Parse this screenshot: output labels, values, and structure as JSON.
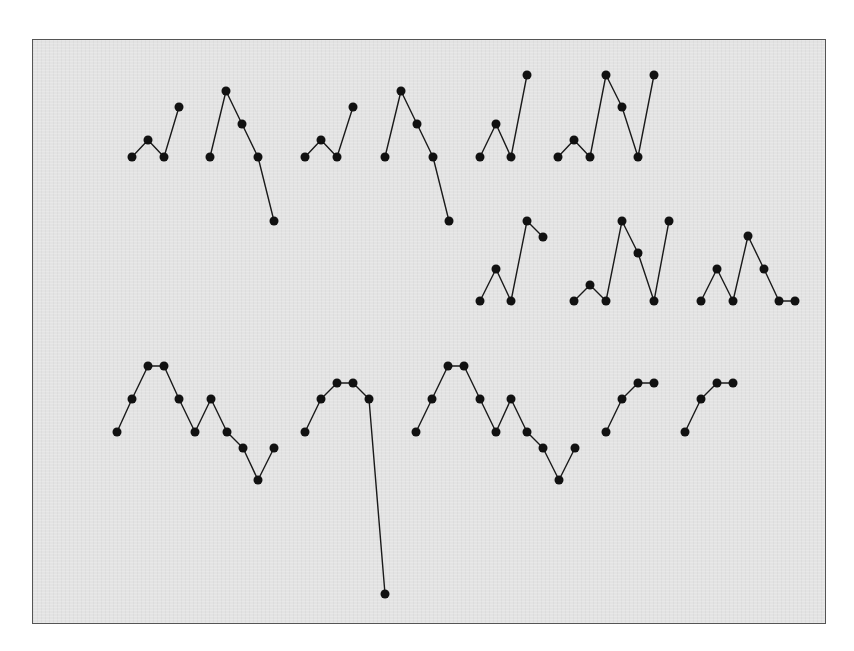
{
  "figure": {
    "panel": {
      "x": 32,
      "y": 39,
      "width": 794,
      "height": 585
    },
    "colors": {
      "background": "#e3e3e3",
      "border": "#555555",
      "line": "#1a1a1a",
      "dot": "#111111"
    },
    "dot_radius": 4.5,
    "sequences": [
      {
        "id": "row1-seq1",
        "points": [
          [
            132,
            157
          ],
          [
            148,
            140
          ],
          [
            164,
            157
          ],
          [
            179,
            107
          ]
        ]
      },
      {
        "id": "row1-seq2",
        "points": [
          [
            210,
            157
          ],
          [
            226,
            91
          ],
          [
            242,
            124
          ],
          [
            258,
            157
          ],
          [
            274,
            221
          ]
        ]
      },
      {
        "id": "row1-seq3",
        "points": [
          [
            305,
            157
          ],
          [
            321,
            140
          ],
          [
            337,
            157
          ],
          [
            353,
            107
          ]
        ]
      },
      {
        "id": "row1-seq4",
        "points": [
          [
            385,
            157
          ],
          [
            401,
            91
          ],
          [
            417,
            124
          ],
          [
            433,
            157
          ],
          [
            449,
            221
          ]
        ]
      },
      {
        "id": "row1-seq5",
        "points": [
          [
            480,
            157
          ],
          [
            496,
            124
          ],
          [
            511,
            157
          ],
          [
            527,
            75
          ]
        ]
      },
      {
        "id": "row1-seq6",
        "points": [
          [
            558,
            157
          ],
          [
            574,
            140
          ],
          [
            590,
            157
          ],
          [
            606,
            75
          ],
          [
            622,
            107
          ],
          [
            638,
            157
          ],
          [
            654,
            75
          ]
        ]
      },
      {
        "id": "row2-seq1",
        "points": [
          [
            480,
            301
          ],
          [
            496,
            269
          ],
          [
            511,
            301
          ],
          [
            527,
            221
          ],
          [
            543,
            237
          ]
        ]
      },
      {
        "id": "row2-seq2",
        "points": [
          [
            574,
            301
          ],
          [
            590,
            285
          ],
          [
            606,
            301
          ],
          [
            622,
            221
          ],
          [
            638,
            253
          ],
          [
            654,
            301
          ],
          [
            669,
            221
          ]
        ]
      },
      {
        "id": "row2-seq3",
        "points": [
          [
            701,
            301
          ],
          [
            717,
            269
          ],
          [
            733,
            301
          ],
          [
            748,
            236
          ],
          [
            764,
            269
          ],
          [
            779,
            301
          ],
          [
            795,
            301
          ]
        ]
      },
      {
        "id": "row3-seq1",
        "points": [
          [
            117,
            432
          ],
          [
            132,
            399
          ],
          [
            148,
            366
          ],
          [
            164,
            366
          ],
          [
            179,
            399
          ],
          [
            195,
            432
          ],
          [
            211,
            399
          ],
          [
            227,
            432
          ],
          [
            243,
            448
          ],
          [
            258,
            480
          ],
          [
            274,
            448
          ]
        ]
      },
      {
        "id": "row3-seq2",
        "points": [
          [
            305,
            432
          ],
          [
            321,
            399
          ],
          [
            337,
            383
          ],
          [
            353,
            383
          ],
          [
            369,
            399
          ],
          [
            385,
            594
          ]
        ]
      },
      {
        "id": "row3-seq3",
        "points": [
          [
            416,
            432
          ],
          [
            432,
            399
          ],
          [
            448,
            366
          ],
          [
            464,
            366
          ],
          [
            480,
            399
          ],
          [
            496,
            432
          ],
          [
            511,
            399
          ],
          [
            527,
            432
          ],
          [
            543,
            448
          ],
          [
            559,
            480
          ],
          [
            575,
            448
          ]
        ]
      },
      {
        "id": "row3-seq4",
        "points": [
          [
            606,
            432
          ],
          [
            622,
            399
          ],
          [
            638,
            383
          ],
          [
            654,
            383
          ]
        ]
      },
      {
        "id": "row3-seq5",
        "points": [
          [
            685,
            432
          ],
          [
            701,
            399
          ],
          [
            717,
            383
          ],
          [
            733,
            383
          ]
        ]
      }
    ]
  }
}
